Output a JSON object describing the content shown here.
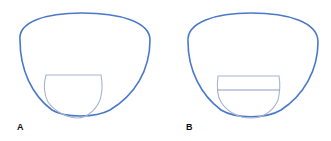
{
  "figure": {
    "panels": [
      {
        "label": "A",
        "description": "Lens outline with single bifocal segment (curved-bottom, flat top)",
        "outline_color": "#4a78c8",
        "segment_color": "#a9b4cc"
      },
      {
        "label": "B",
        "description": "Lens outline with segment divided by a horizontal line (trifocal/executive style)",
        "outline_color": "#4a78c8",
        "segment_color": "#a9b4cc"
      }
    ]
  }
}
